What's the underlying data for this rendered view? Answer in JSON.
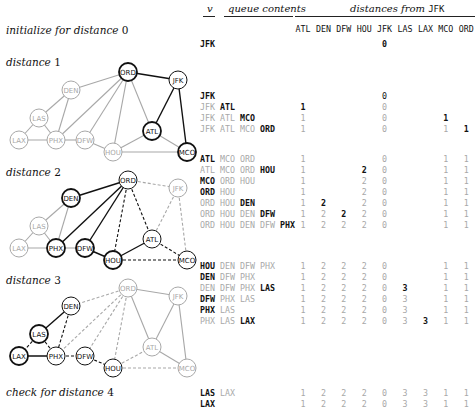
{
  "header": {
    "v_label": "v",
    "queue_label": "queue contents",
    "distances_label": "distances from",
    "source": "JFK",
    "columns": [
      "ATL",
      "DEN",
      "DFW",
      "HOU",
      "JFK",
      "LAS",
      "LAX",
      "MCO",
      "ORD"
    ]
  },
  "colors": {
    "bold": "#111111",
    "dim": "#a8a8a8",
    "node_fill": "#ffffff"
  },
  "steps": [
    {
      "label_text": "initialize for distance",
      "label_num": "0",
      "label_y": 24
    },
    {
      "label_text": "distance",
      "label_num": "1",
      "label_y": 56
    },
    {
      "label_text": "distance",
      "label_num": "2",
      "label_y": 166
    },
    {
      "label_text": "distance",
      "label_num": "3",
      "label_y": 274
    },
    {
      "label_text": "check for distance",
      "label_num": "4",
      "label_y": 386
    }
  ],
  "rows": [
    {
      "y": 39,
      "queue": [
        {
          "t": "JFK",
          "s": "b"
        }
      ],
      "dist": [
        "",
        "",
        "",
        "",
        "0",
        "",
        "",
        "",
        ""
      ],
      "bold_col": -1,
      "dim_all_but_bold": false
    },
    {
      "y": 91,
      "queue": [
        {
          "t": "JFK",
          "s": "b"
        }
      ],
      "dist": [
        "",
        "",
        "",
        "",
        "0",
        "",
        "",
        "",
        ""
      ],
      "bold_col": -1
    },
    {
      "y": 102,
      "queue": [
        {
          "t": "JFK",
          "s": "d"
        },
        {
          "t": "ATL",
          "s": "b"
        }
      ],
      "dist": [
        "1",
        "",
        "",
        "",
        "0",
        "",
        "",
        "",
        ""
      ],
      "bold_col": 0
    },
    {
      "y": 113,
      "queue": [
        {
          "t": "JFK",
          "s": "d"
        },
        {
          "t": "ATL",
          "s": "d"
        },
        {
          "t": "MCO",
          "s": "b"
        }
      ],
      "dist": [
        "1",
        "",
        "",
        "",
        "0",
        "",
        "",
        "1",
        ""
      ],
      "bold_col": 7
    },
    {
      "y": 124,
      "queue": [
        {
          "t": "JFK",
          "s": "d"
        },
        {
          "t": "ATL",
          "s": "d"
        },
        {
          "t": "MCO",
          "s": "d"
        },
        {
          "t": "ORD",
          "s": "b"
        }
      ],
      "dist": [
        "1",
        "",
        "",
        "",
        "0",
        "",
        "",
        "1",
        "1"
      ],
      "bold_col": 8
    },
    {
      "y": 154,
      "queue": [
        {
          "t": "ATL",
          "s": "b"
        },
        {
          "t": "MCO",
          "s": "d"
        },
        {
          "t": "ORD",
          "s": "d"
        }
      ],
      "dist": [
        "1",
        "",
        "",
        "",
        "0",
        "",
        "",
        "1",
        "1"
      ],
      "bold_col": -1
    },
    {
      "y": 165,
      "queue": [
        {
          "t": "ATL",
          "s": "d"
        },
        {
          "t": "MCO",
          "s": "d"
        },
        {
          "t": "ORD",
          "s": "d"
        },
        {
          "t": "HOU",
          "s": "b"
        }
      ],
      "dist": [
        "1",
        "",
        "",
        "2",
        "0",
        "",
        "",
        "1",
        "1"
      ],
      "bold_col": 3
    },
    {
      "y": 176,
      "queue": [
        {
          "t": "MCO",
          "s": "b"
        },
        {
          "t": "ORD",
          "s": "d"
        },
        {
          "t": "HOU",
          "s": "d"
        }
      ],
      "dist": [
        "1",
        "",
        "",
        "2",
        "0",
        "",
        "",
        "1",
        "1"
      ],
      "bold_col": -1
    },
    {
      "y": 187,
      "queue": [
        {
          "t": "ORD",
          "s": "b"
        },
        {
          "t": "HOU",
          "s": "d"
        }
      ],
      "dist": [
        "1",
        "",
        "",
        "2",
        "0",
        "",
        "",
        "1",
        "1"
      ],
      "bold_col": -1
    },
    {
      "y": 198,
      "queue": [
        {
          "t": "ORD",
          "s": "d"
        },
        {
          "t": "HOU",
          "s": "d"
        },
        {
          "t": "DEN",
          "s": "b"
        }
      ],
      "dist": [
        "1",
        "2",
        "",
        "2",
        "0",
        "",
        "",
        "1",
        "1"
      ],
      "bold_col": 1
    },
    {
      "y": 209,
      "queue": [
        {
          "t": "ORD",
          "s": "d"
        },
        {
          "t": "HOU",
          "s": "d"
        },
        {
          "t": "DEN",
          "s": "d"
        },
        {
          "t": "DFW",
          "s": "b"
        }
      ],
      "dist": [
        "1",
        "2",
        "2",
        "2",
        "0",
        "",
        "",
        "1",
        "1"
      ],
      "bold_col": 2
    },
    {
      "y": 220,
      "queue": [
        {
          "t": "ORD",
          "s": "d"
        },
        {
          "t": "HOU",
          "s": "d"
        },
        {
          "t": "DEN",
          "s": "d"
        },
        {
          "t": "DFW",
          "s": "d"
        },
        {
          "t": "PHX",
          "s": "b"
        }
      ],
      "dist": [
        "1",
        "2",
        "2",
        "2",
        "0",
        "",
        "",
        "1",
        "1"
      ],
      "bold_col": -1
    },
    {
      "y": 261,
      "queue": [
        {
          "t": "HOU",
          "s": "b"
        },
        {
          "t": "DEN",
          "s": "d"
        },
        {
          "t": "DFW",
          "s": "d"
        },
        {
          "t": "PHX",
          "s": "d"
        }
      ],
      "dist": [
        "1",
        "2",
        "2",
        "2",
        "0",
        "",
        "",
        "1",
        "1"
      ],
      "bold_col": -1
    },
    {
      "y": 272,
      "queue": [
        {
          "t": "DEN",
          "s": "b"
        },
        {
          "t": "DFW",
          "s": "d"
        },
        {
          "t": "PHX",
          "s": "d"
        }
      ],
      "dist": [
        "1",
        "2",
        "2",
        "2",
        "0",
        "",
        "",
        "1",
        "1"
      ],
      "bold_col": -1
    },
    {
      "y": 283,
      "queue": [
        {
          "t": "DEN",
          "s": "d"
        },
        {
          "t": "DFW",
          "s": "d"
        },
        {
          "t": "PHX",
          "s": "d"
        },
        {
          "t": "LAS",
          "s": "b"
        }
      ],
      "dist": [
        "1",
        "2",
        "2",
        "2",
        "0",
        "3",
        "",
        "1",
        "1"
      ],
      "bold_col": 5
    },
    {
      "y": 294,
      "queue": [
        {
          "t": "DFW",
          "s": "b"
        },
        {
          "t": "PHX",
          "s": "d"
        },
        {
          "t": "LAS",
          "s": "d"
        }
      ],
      "dist": [
        "1",
        "2",
        "2",
        "2",
        "0",
        "3",
        "",
        "1",
        "1"
      ],
      "bold_col": -1
    },
    {
      "y": 305,
      "queue": [
        {
          "t": "PHX",
          "s": "b"
        },
        {
          "t": "LAS",
          "s": "d"
        }
      ],
      "dist": [
        "1",
        "2",
        "2",
        "2",
        "0",
        "3",
        "",
        "1",
        "1"
      ],
      "bold_col": -1
    },
    {
      "y": 316,
      "queue": [
        {
          "t": "PHX",
          "s": "d"
        },
        {
          "t": "LAS",
          "s": "d"
        },
        {
          "t": "LAX",
          "s": "b"
        }
      ],
      "dist": [
        "1",
        "2",
        "2",
        "2",
        "0",
        "3",
        "3",
        "1",
        "1"
      ],
      "bold_col": 6
    },
    {
      "y": 388,
      "queue": [
        {
          "t": "LAS",
          "s": "b"
        },
        {
          "t": "LAX",
          "s": "d"
        }
      ],
      "dist": [
        "1",
        "2",
        "2",
        "2",
        "0",
        "3",
        "3",
        "1",
        "1"
      ],
      "bold_col": -1
    },
    {
      "y": 399,
      "queue": [
        {
          "t": "LAX",
          "s": "b"
        }
      ],
      "dist": [
        "1",
        "2",
        "2",
        "2",
        "0",
        "3",
        "3",
        "1",
        "1"
      ],
      "bold_col": -1
    }
  ],
  "graph": {
    "nodes": {
      "ORD": [
        128,
        12
      ],
      "JFK": [
        178,
        20
      ],
      "DEN": [
        71,
        30
      ],
      "LAS": [
        39,
        58
      ],
      "LAX": [
        19,
        80
      ],
      "PHX": [
        56,
        80
      ],
      "DFW": [
        85,
        80
      ],
      "HOU": [
        113,
        92
      ],
      "ATL": [
        152,
        71
      ],
      "MCO": [
        187,
        92
      ]
    },
    "edges": [
      [
        "ORD",
        "JFK"
      ],
      [
        "ORD",
        "DEN"
      ],
      [
        "ORD",
        "PHX"
      ],
      [
        "ORD",
        "DFW"
      ],
      [
        "ORD",
        "HOU"
      ],
      [
        "ORD",
        "ATL"
      ],
      [
        "JFK",
        "ATL"
      ],
      [
        "JFK",
        "MCO"
      ],
      [
        "DEN",
        "LAS"
      ],
      [
        "DEN",
        "PHX"
      ],
      [
        "LAS",
        "LAX"
      ],
      [
        "LAS",
        "PHX"
      ],
      [
        "LAX",
        "PHX"
      ],
      [
        "PHX",
        "DFW"
      ],
      [
        "DFW",
        "HOU"
      ],
      [
        "HOU",
        "ATL"
      ],
      [
        "HOU",
        "MCO"
      ],
      [
        "ATL",
        "MCO"
      ]
    ],
    "panels": [
      {
        "name": "graph-distance-1",
        "top": 60,
        "bold_nodes": [
          "ORD",
          "ATL",
          "MCO"
        ],
        "dim_nodes": [
          "DEN",
          "LAS",
          "LAX",
          "PHX",
          "DFW",
          "HOU"
        ],
        "bold_edges": [
          "ORD-JFK",
          "JFK-ATL",
          "JFK-MCO"
        ],
        "dashed_edges": [],
        "dim_edges": [
          "ORD-DEN",
          "ORD-PHX",
          "ORD-DFW",
          "ORD-HOU",
          "ORD-ATL",
          "DEN-LAS",
          "DEN-PHX",
          "LAS-LAX",
          "LAS-PHX",
          "LAX-PHX",
          "PHX-DFW",
          "DFW-HOU",
          "HOU-ATL",
          "HOU-MCO",
          "ATL-MCO"
        ],
        "normal_edges": []
      },
      {
        "name": "graph-distance-2",
        "top": 168,
        "bold_nodes": [
          "DEN",
          "PHX",
          "DFW",
          "HOU"
        ],
        "dim_nodes": [
          "JFK",
          "LAS",
          "LAX"
        ],
        "bold_edges": [
          "ORD-DEN",
          "ORD-PHX",
          "ORD-DFW",
          "HOU-ATL",
          "DFW-HOU"
        ],
        "dashed_edges": [
          "ORD-HOU",
          "ORD-ATL",
          "HOU-MCO",
          "ATL-MCO"
        ],
        "dim_dashed_edges": [
          "ORD-JFK",
          "JFK-ATL",
          "JFK-MCO"
        ],
        "dim_edges": [
          "DEN-LAS",
          "DEN-PHX",
          "LAS-LAX",
          "LAS-PHX",
          "LAX-PHX",
          "PHX-DFW"
        ],
        "normal_edges": []
      },
      {
        "name": "graph-distance-3",
        "top": 276,
        "bold_nodes": [
          "LAS",
          "LAX"
        ],
        "dim_nodes": [
          "ORD",
          "JFK",
          "ATL",
          "MCO"
        ],
        "bold_edges": [
          "DEN-LAS",
          "LAX-PHX"
        ],
        "dashed_edges": [
          "DEN-PHX",
          "PHX-DFW",
          "DFW-HOU",
          "LAS-PHX",
          "LAS-LAX"
        ],
        "dim_dashed_edges": [
          "ORD-DEN",
          "ORD-PHX",
          "ORD-DFW",
          "ORD-HOU",
          "HOU-ATL",
          "HOU-MCO"
        ],
        "dim_edges": [
          "ORD-JFK",
          "JFK-ATL",
          "JFK-MCO",
          "ORD-ATL",
          "ATL-MCO"
        ],
        "normal_edges": []
      }
    ]
  }
}
